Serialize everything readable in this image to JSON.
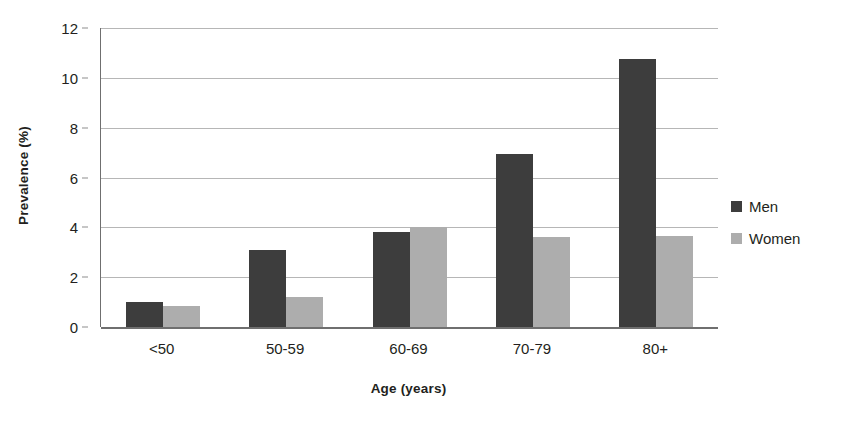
{
  "chart_data": {
    "type": "bar",
    "title": "",
    "xlabel": "Age (years)",
    "ylabel": "Prevalence (%)",
    "categories": [
      "<50",
      "50-59",
      "60-69",
      "70-79",
      "80+"
    ],
    "series": [
      {
        "name": "Men",
        "color": "#3d3d3d",
        "values": [
          1.0,
          3.1,
          3.8,
          6.95,
          10.75
        ]
      },
      {
        "name": "Women",
        "color": "#adadad",
        "values": [
          0.85,
          1.2,
          4.0,
          3.6,
          3.65
        ]
      }
    ],
    "ylim": [
      0,
      12
    ],
    "yticks": [
      0,
      2,
      4,
      6,
      8,
      10,
      12
    ],
    "ytick_labels": [
      "0",
      "2",
      "4",
      "6",
      "8",
      "10",
      "12"
    ],
    "grid": true,
    "grid_axis": "y",
    "legend_position": "right",
    "bar_group_layout": "grouped",
    "background": "#ffffff",
    "axis_color": "#6f6f6f",
    "gridline_color": "#b6b6b6",
    "text_color": "#231f20"
  }
}
